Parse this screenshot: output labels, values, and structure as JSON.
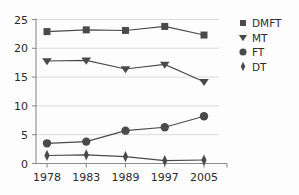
{
  "chart_data": {
    "type": "line",
    "title": "",
    "subtitle": "",
    "xlabel": "",
    "ylabel": "",
    "categories": [
      "1978",
      "1983",
      "1989",
      "1997",
      "2005"
    ],
    "x": [
      1978,
      1983,
      1989,
      1997,
      2005
    ],
    "ylim": [
      0,
      25
    ],
    "xlim_labels": [
      "1978",
      "2005"
    ],
    "yticks": [
      "0",
      "5",
      "10",
      "15",
      "20",
      "25"
    ],
    "ytick_values": [
      0,
      5,
      10,
      15,
      20,
      25
    ],
    "grid": "horizontal",
    "legend_position": "right",
    "series": [
      {
        "name": "DMFT",
        "marker": "square",
        "color": "#4a4a4a",
        "values": [
          22.9,
          23.2,
          23.1,
          23.8,
          22.3
        ]
      },
      {
        "name": "MT",
        "marker": "triangle-down",
        "color": "#4a4a4a",
        "values": [
          17.8,
          17.9,
          16.4,
          17.2,
          14.2
        ]
      },
      {
        "name": "FT",
        "marker": "circle",
        "color": "#4a4a4a",
        "values": [
          3.5,
          3.8,
          5.7,
          6.3,
          8.2
        ]
      },
      {
        "name": "DT",
        "marker": "diamond",
        "color": "#4a4a4a",
        "values": [
          1.4,
          1.5,
          1.2,
          0.5,
          0.6
        ]
      }
    ]
  },
  "legend": {
    "items": [
      {
        "label": "DMFT",
        "marker": "square"
      },
      {
        "label": "MT",
        "marker": "triangle-down"
      },
      {
        "label": "FT",
        "marker": "circle"
      },
      {
        "label": "DT",
        "marker": "diamond"
      }
    ]
  },
  "colors": {
    "series": "#4a4a4a",
    "axis": "#8a8a8a",
    "grid": "#d8d8d8",
    "text": "#2b2b2b",
    "background": "#fdfdfd"
  }
}
